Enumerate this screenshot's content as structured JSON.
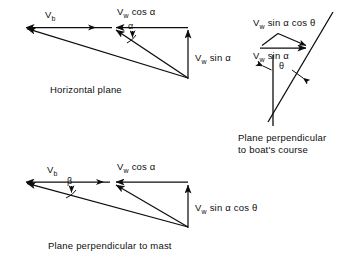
{
  "figure": {
    "background_color": "#ffffff",
    "ink_color": "#0d0d0d"
  },
  "diagrams": [
    {
      "id": "horizontal-plane",
      "caption": "Horizontal plane",
      "labels": {
        "boat_velocity": "V<sub>b</sub>",
        "wind_horizontal": "V<sub>w</sub> cos α",
        "wind_vertical": "V<sub>w</sub> sin α",
        "angle": "α"
      }
    },
    {
      "id": "plane-perpendicular-to-boats-course",
      "caption_line1": "Plane perpendicular",
      "caption_line2": "to boat's course",
      "labels": {
        "component_upper": "V<sub>w</sub> sin α cos θ",
        "component_lower": "V<sub>w</sub> sin α",
        "angle": "θ"
      }
    },
    {
      "id": "plane-perpendicular-to-mast",
      "caption": "Plane perpendicular to mast",
      "labels": {
        "boat_velocity": "V<sub>b</sub>",
        "wind_horizontal": "V<sub>w</sub> cos α",
        "wind_vertical": "V<sub>w</sub> sin α cos θ",
        "angle": "β"
      }
    }
  ],
  "text": {
    "vb": "V",
    "vb_sub": "b",
    "vw": "V",
    "vw_sub": "w",
    "cos_alpha": " cos α",
    "sin_alpha": " sin α",
    "sin_alpha_cos_theta": " sin α cos θ",
    "alpha": "α",
    "beta": "β",
    "theta": "θ",
    "caption_horizontal": "Horizontal plane",
    "caption_course_1": "Plane perpendicular",
    "caption_course_2": "to boat's course",
    "caption_mast": "Plane perpendicular to mast"
  }
}
